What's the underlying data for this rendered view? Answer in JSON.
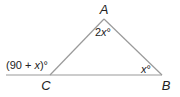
{
  "diagram": {
    "type": "triangle-exterior-angle",
    "vertices": {
      "A": {
        "label": "A",
        "x": 104,
        "y": 19
      },
      "B": {
        "label": "B",
        "x": 162,
        "y": 75
      },
      "C": {
        "label": "C",
        "x": 50,
        "y": 75
      }
    },
    "base_line": {
      "x1": 6,
      "x2": 162,
      "y": 75
    },
    "angles": {
      "A": {
        "label_prefix": "2",
        "variable": "x",
        "suffix": "°"
      },
      "B": {
        "label_prefix": "",
        "variable": "x",
        "suffix": "°"
      },
      "exterior_C": {
        "open": "(90 + ",
        "variable": "x",
        "close": ")°"
      }
    },
    "colors": {
      "line": "#9a9a9a",
      "text": "#222222"
    }
  }
}
